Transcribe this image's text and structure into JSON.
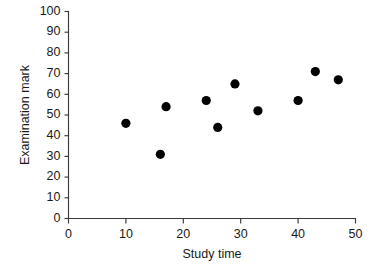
{
  "chart_data": {
    "type": "scatter",
    "title": "",
    "xlabel": "Study time",
    "ylabel": "Examination mark",
    "xlim": [
      0,
      50
    ],
    "ylim": [
      0,
      100
    ],
    "xticks": [
      0,
      10,
      20,
      30,
      40,
      50
    ],
    "yticks": [
      0,
      10,
      20,
      30,
      40,
      50,
      60,
      70,
      80,
      90,
      100
    ],
    "xtick_labels": [
      "0",
      "10",
      "20",
      "30",
      "40",
      "50"
    ],
    "ytick_labels": [
      "0",
      "10",
      "20",
      "30",
      "40",
      "50",
      "60",
      "70",
      "80",
      "90",
      "100"
    ],
    "grid": false,
    "legend": null,
    "marker": "filled-circle",
    "marker_color": "#000000",
    "series": [
      {
        "name": "students",
        "points": [
          {
            "x": 10,
            "y": 46
          },
          {
            "x": 16,
            "y": 31
          },
          {
            "x": 17,
            "y": 54
          },
          {
            "x": 24,
            "y": 57
          },
          {
            "x": 26,
            "y": 44
          },
          {
            "x": 29,
            "y": 65
          },
          {
            "x": 33,
            "y": 52
          },
          {
            "x": 40,
            "y": 57
          },
          {
            "x": 43,
            "y": 71
          },
          {
            "x": 47,
            "y": 67
          }
        ]
      }
    ]
  },
  "colors": {
    "marker": "#000000",
    "axis": "#3a3a3a",
    "text": "#1a1a1a",
    "background": "#ffffff"
  }
}
